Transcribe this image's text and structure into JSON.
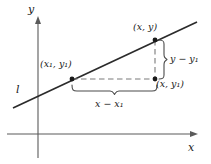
{
  "figure": {
    "colors": {
      "axis": "#5a5a5a",
      "line": "#2b2b2b",
      "dashed": "#7a7a7a",
      "brace": "#4a4a4a",
      "text": "#1a1a1a",
      "background": "#ffffff"
    },
    "axes": {
      "x_label": "x",
      "y_label": "y",
      "origin": {
        "x": 38,
        "y": 134
      },
      "x_axis": {
        "x_start": 7,
        "x_end": 198,
        "y": 134
      },
      "y_axis": {
        "x": 38,
        "y_start": 17,
        "y_end": 158
      }
    },
    "line": {
      "label": "l",
      "start": {
        "x": 13,
        "y": 108
      },
      "end": {
        "x": 197,
        "y": 22
      }
    },
    "points": [
      {
        "name": "point-x1-y1",
        "label": "(x₁, y₁)",
        "px": 72,
        "py": 79
      },
      {
        "name": "point-x-y",
        "label": "(x, y)",
        "px": 155,
        "py": 40
      },
      {
        "name": "point-x-y1",
        "label": "(x, y₁)",
        "px": 155,
        "py": 79
      }
    ],
    "segments": [
      {
        "name": "horizontal-run",
        "label": "x − x₁",
        "orientation": "horizontal",
        "from": 72,
        "to": 155,
        "at": 79
      },
      {
        "name": "vertical-rise",
        "label": "y − y₁",
        "orientation": "vertical",
        "from": 40,
        "to": 79,
        "at": 155
      }
    ],
    "braces": {
      "run": {
        "name": "run-brace",
        "x_start": 72,
        "x_end": 157,
        "y": 89
      },
      "rise": {
        "name": "rise-brace",
        "y_start": 40,
        "y_end": 79,
        "x": 162
      }
    }
  }
}
